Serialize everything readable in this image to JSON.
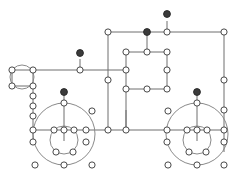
{
  "diagram": {
    "width": 244,
    "height": 188,
    "background_color": "#ffffff",
    "edge_color": "#6e6e6e",
    "ring_color": "#8a8a8a",
    "node_open_fill": "#ffffff",
    "node_open_stroke": "#4a4a4a",
    "node_filled_fill": "#3b3b3b",
    "node_radius_open": 3.1,
    "node_radius_filled": 3.4,
    "counts": {
      "open_nodes": 73,
      "filled_nodes": 5,
      "edges": 62,
      "rings": 6
    },
    "rings": [
      {
        "name": "left-wheel-outer",
        "cx": 64,
        "cy": 134,
        "r": 31
      },
      {
        "name": "left-wheel-inner",
        "cx": 64,
        "cy": 140,
        "r": 14
      },
      {
        "name": "right-wheel-outer",
        "cx": 197,
        "cy": 134,
        "r": 31
      },
      {
        "name": "right-wheel-inner",
        "cx": 197,
        "cy": 140,
        "r": 14
      },
      {
        "name": "top-left-small-circle",
        "cx": 22,
        "cy": 77,
        "r": 12
      }
    ],
    "edges": [
      [
        108,
        32,
        167,
        32
      ],
      [
        167,
        32,
        224,
        32
      ],
      [
        108,
        32,
        108,
        80
      ],
      [
        108,
        80,
        108,
        130
      ],
      [
        167,
        21,
        167,
        32
      ],
      [
        147,
        32,
        147,
        52
      ],
      [
        224,
        32,
        224,
        80
      ],
      [
        224,
        80,
        224,
        110
      ],
      [
        224,
        110,
        224,
        130
      ],
      [
        224,
        130,
        224,
        142
      ],
      [
        224,
        142,
        224,
        152
      ],
      [
        126,
        52,
        147,
        52
      ],
      [
        147,
        52,
        167,
        52
      ],
      [
        126,
        52,
        126,
        70
      ],
      [
        167,
        52,
        167,
        70
      ],
      [
        126,
        70,
        126,
        89
      ],
      [
        167,
        70,
        167,
        89
      ],
      [
        126,
        89,
        147,
        89
      ],
      [
        147,
        89,
        167,
        89
      ],
      [
        33,
        70,
        33,
        70
      ],
      [
        12,
        70,
        33,
        70
      ],
      [
        12,
        70,
        12,
        86
      ],
      [
        33,
        70,
        33,
        86
      ],
      [
        12,
        86,
        33,
        86
      ],
      [
        33,
        70,
        80,
        70
      ],
      [
        80,
        70,
        126,
        70
      ],
      [
        80,
        59,
        80,
        70
      ],
      [
        33,
        86,
        33,
        96
      ],
      [
        33,
        96,
        33,
        106
      ],
      [
        33,
        106,
        33,
        116
      ],
      [
        33,
        116,
        33,
        130
      ],
      [
        33,
        130,
        33,
        142
      ],
      [
        33,
        130,
        64,
        130
      ],
      [
        64,
        130,
        86,
        130
      ],
      [
        86,
        130,
        108,
        130
      ],
      [
        108,
        130,
        126,
        130
      ],
      [
        126,
        130,
        167,
        130
      ],
      [
        167,
        130,
        197,
        130
      ],
      [
        197,
        130,
        224,
        130
      ],
      [
        64,
        103,
        64,
        112
      ],
      [
        64,
        92,
        64,
        103
      ],
      [
        64,
        112,
        64,
        130
      ],
      [
        64,
        130,
        64,
        141
      ],
      [
        54,
        130,
        54,
        130
      ],
      [
        197,
        103,
        197,
        112
      ],
      [
        197,
        92,
        197,
        103
      ],
      [
        197,
        112,
        197,
        130
      ],
      [
        197,
        130,
        197,
        141
      ],
      [
        126,
        89,
        126,
        130
      ],
      [
        126,
        110,
        126,
        130
      ]
    ],
    "nodes_open": [
      {
        "x": 108,
        "y": 32,
        "name": "top-left-junction"
      },
      {
        "x": 167,
        "y": 32,
        "name": "top-mid-junction"
      },
      {
        "x": 224,
        "y": 32,
        "name": "top-right-corner"
      },
      {
        "x": 126,
        "y": 52,
        "name": "box-top-left"
      },
      {
        "x": 147,
        "y": 52,
        "name": "box-top-mid"
      },
      {
        "x": 167,
        "y": 52,
        "name": "box-top-right"
      },
      {
        "x": 126,
        "y": 70,
        "name": "box-mid-left"
      },
      {
        "x": 167,
        "y": 70,
        "name": "box-mid-right"
      },
      {
        "x": 126,
        "y": 89,
        "name": "box-bottom-left"
      },
      {
        "x": 147,
        "y": 89,
        "name": "box-bottom-mid"
      },
      {
        "x": 167,
        "y": 89,
        "name": "box-bottom-right"
      },
      {
        "x": 108,
        "y": 80,
        "name": "left-vertical-mid"
      },
      {
        "x": 224,
        "y": 80,
        "name": "right-rail-upper"
      },
      {
        "x": 224,
        "y": 110,
        "name": "right-rail-lower"
      },
      {
        "x": 12,
        "y": 70,
        "name": "small-circle-top-left"
      },
      {
        "x": 33,
        "y": 70,
        "name": "small-circle-top-right"
      },
      {
        "x": 12,
        "y": 86,
        "name": "small-circle-bottom-left"
      },
      {
        "x": 33,
        "y": 86,
        "name": "small-circle-bottom-right"
      },
      {
        "x": 80,
        "y": 70,
        "name": "upper-rail-node"
      },
      {
        "x": 33,
        "y": 96,
        "name": "left-chain-1"
      },
      {
        "x": 33,
        "y": 106,
        "name": "left-chain-2"
      },
      {
        "x": 33,
        "y": 116,
        "name": "left-chain-3"
      },
      {
        "x": 33,
        "y": 130,
        "name": "left-chain-4"
      },
      {
        "x": 33,
        "y": 142,
        "name": "left-chain-5"
      },
      {
        "x": 64,
        "y": 103,
        "name": "left-wheel-top"
      },
      {
        "x": 64,
        "y": 130,
        "name": "left-wheel-hub"
      },
      {
        "x": 54,
        "y": 130,
        "name": "left-hub-west"
      },
      {
        "x": 74,
        "y": 130,
        "name": "left-hub-east"
      },
      {
        "x": 86,
        "y": 130,
        "name": "left-wheel-east"
      },
      {
        "x": 86,
        "y": 142,
        "name": "left-wheel-se"
      },
      {
        "x": 56,
        "y": 152,
        "name": "left-inner-sw"
      },
      {
        "x": 73,
        "y": 152,
        "name": "left-inner-se"
      },
      {
        "x": 64,
        "y": 165,
        "name": "left-wheel-bottom"
      },
      {
        "x": 35,
        "y": 165,
        "name": "left-loose-sw"
      },
      {
        "x": 92,
        "y": 165,
        "name": "left-loose-se"
      },
      {
        "x": 92,
        "y": 111,
        "name": "left-loose-ne"
      },
      {
        "x": 108,
        "y": 130,
        "name": "center-bottom-left"
      },
      {
        "x": 126,
        "y": 130,
        "name": "center-bottom-right"
      },
      {
        "x": 197,
        "y": 103,
        "name": "right-wheel-top"
      },
      {
        "x": 197,
        "y": 130,
        "name": "right-wheel-hub"
      },
      {
        "x": 187,
        "y": 130,
        "name": "right-hub-west"
      },
      {
        "x": 207,
        "y": 130,
        "name": "right-hub-east"
      },
      {
        "x": 167,
        "y": 130,
        "name": "right-wheel-west"
      },
      {
        "x": 167,
        "y": 142,
        "name": "right-wheel-sw"
      },
      {
        "x": 189,
        "y": 152,
        "name": "right-inner-sw"
      },
      {
        "x": 206,
        "y": 152,
        "name": "right-inner-se"
      },
      {
        "x": 197,
        "y": 165,
        "name": "right-wheel-bottom"
      },
      {
        "x": 168,
        "y": 165,
        "name": "right-loose-sw"
      },
      {
        "x": 224,
        "y": 165,
        "name": "right-loose-se"
      },
      {
        "x": 168,
        "y": 111,
        "name": "right-loose-nw"
      },
      {
        "x": 224,
        "y": 130,
        "name": "right-rail-hub"
      },
      {
        "x": 224,
        "y": 142,
        "name": "right-rail-hub-lower"
      }
    ],
    "nodes_filled": [
      {
        "x": 167,
        "y": 14,
        "name": "filled-top-stem"
      },
      {
        "x": 147,
        "y": 32,
        "name": "filled-inner-stem"
      },
      {
        "x": 80,
        "y": 53,
        "name": "filled-left-stem"
      },
      {
        "x": 64,
        "y": 92,
        "name": "filled-left-wheel-stem"
      },
      {
        "x": 197,
        "y": 92,
        "name": "filled-right-wheel-stem"
      }
    ]
  }
}
